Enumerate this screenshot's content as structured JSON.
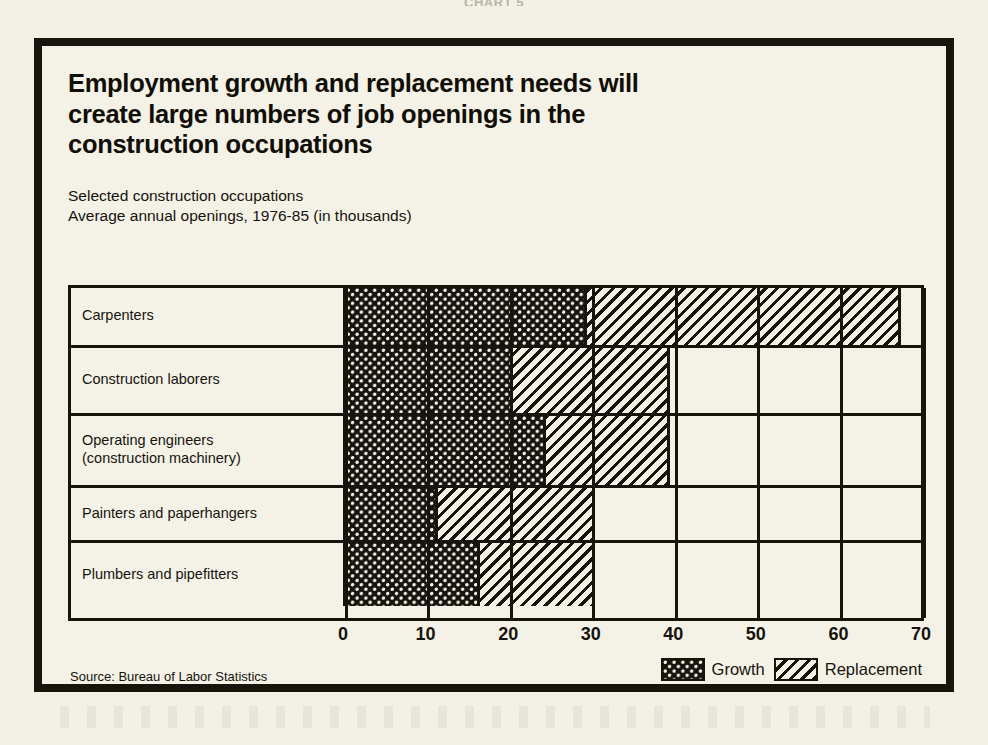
{
  "page": {
    "crop_header": "CHART 5",
    "background_color": "#f3f1e6",
    "ink_color": "#17140e"
  },
  "figure": {
    "title": "Employment growth and replacement needs will create large numbers of job openings in the construction occupations",
    "subtitle_line1": "Selected construction occupations",
    "subtitle_line2": "Average annual openings, 1976-85 (in thousands)",
    "source": "Source: Bureau of Labor Statistics"
  },
  "legend": {
    "items": [
      {
        "label": "Growth",
        "pattern": "cross-hatch-dot",
        "color": "#17140e"
      },
      {
        "label": "Replacement",
        "pattern": "diagonal-stripe",
        "color": "#17140e"
      }
    ]
  },
  "axis": {
    "ticks": [
      "0",
      "10",
      "20",
      "30",
      "40",
      "50",
      "60",
      "70"
    ],
    "min": 0,
    "max": 70,
    "step": 10
  },
  "rows": [
    {
      "label": "Carpenters",
      "growth": 29,
      "replacement": 38,
      "total": 67
    },
    {
      "label": "Construction laborers",
      "growth": 20,
      "replacement": 19,
      "total": 39
    },
    {
      "label": "Operating engineers\n(construction machinery)",
      "growth": 24,
      "replacement": 15,
      "total": 39
    },
    {
      "label": "Painters and paperhangers",
      "growth": 11,
      "replacement": 19,
      "total": 30
    },
    {
      "label": "Plumbers and pipefitters",
      "growth": 16,
      "replacement": 14,
      "total": 30
    }
  ],
  "chart_data": {
    "type": "bar",
    "orientation": "horizontal",
    "stacked": true,
    "title": "Employment growth and replacement needs will create large numbers of job openings in the construction occupations",
    "subtitle": "Selected construction occupations — Average annual openings, 1976-85 (in thousands)",
    "xlabel": "Average annual openings (thousands)",
    "ylabel": "",
    "xlim": [
      0,
      70
    ],
    "xticks": [
      0,
      10,
      20,
      30,
      40,
      50,
      60,
      70
    ],
    "grid": true,
    "legend_position": "bottom-right",
    "categories": [
      "Carpenters",
      "Construction laborers",
      "Operating engineers (construction machinery)",
      "Painters and paperhangers",
      "Plumbers and pipefitters"
    ],
    "series": [
      {
        "name": "Growth",
        "values": [
          29,
          20,
          24,
          11,
          16
        ]
      },
      {
        "name": "Replacement",
        "values": [
          38,
          19,
          15,
          19,
          14
        ]
      }
    ],
    "totals": [
      67,
      39,
      39,
      30,
      30
    ],
    "source": "Source: Bureau of Labor Statistics"
  }
}
